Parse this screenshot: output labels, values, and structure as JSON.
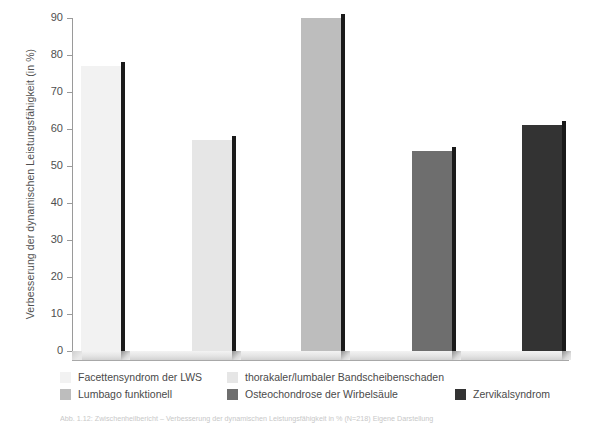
{
  "chart_data": {
    "type": "bar",
    "title": "",
    "xlabel": "",
    "ylabel": "Verbesserung der dynamischen Leistungsfähigkeit (in %)",
    "ylim": [
      0,
      90
    ],
    "yticks": [
      0,
      10,
      20,
      30,
      40,
      50,
      60,
      70,
      80,
      90
    ],
    "grid": false,
    "legend_position": "bottom",
    "categories": [
      "Facettensyndrom der LWS",
      "thorakaler/lumbaler Bandscheibenschaden",
      "Lumbago funktionell",
      "Osteochondrose der Wirbelsäule",
      "Zervikalsyndrom"
    ],
    "values": [
      77,
      57,
      90,
      54,
      61
    ],
    "bar_colors": [
      "#f2f2f2",
      "#e6e6e6",
      "#bdbdbd",
      "#6e6e6e",
      "#333333"
    ],
    "bar_side_color": "#1a1a1a"
  },
  "legend": {
    "rows": [
      [
        {
          "label": "Facettensyndrom der LWS",
          "color": "#f2f2f2",
          "left": 0
        },
        {
          "label": "thorakaler/lumbaler Bandscheibenschaden",
          "color": "#e6e6e6",
          "left": 167
        }
      ],
      [
        {
          "label": "Lumbago funktionell",
          "color": "#bdbdbd",
          "left": 0
        },
        {
          "label": "Osteochondrose der Wirbelsäule",
          "color": "#6e6e6e",
          "left": 167
        },
        {
          "label": "Zervikalsyndrom",
          "color": "#333333",
          "left": 395
        }
      ]
    ]
  },
  "caption": {
    "text": "Abb. 1.12: Zwischenheilbericht – Verbesserung der dynamischen Leistungsfähigkeit in % (N=218) Eigene Darstellung"
  },
  "axis": {
    "tick_labels": [
      "90",
      "80",
      "70",
      "60",
      "50",
      "40",
      "30",
      "20",
      "10",
      "0"
    ],
    "axis_color": "#9a9a9a",
    "text_color": "#4f4f4f"
  }
}
